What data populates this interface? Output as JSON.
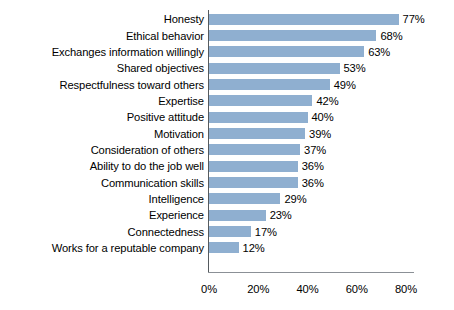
{
  "chart_data": {
    "type": "bar",
    "orientation": "horizontal",
    "title": "",
    "xlabel": "",
    "ylabel": "",
    "xlim": [
      0,
      80
    ],
    "grid": false,
    "legend": null,
    "bar_color": "#8fafd0",
    "axis_color": "#555a5e",
    "categories": [
      "Honesty",
      "Ethical behavior",
      "Exchanges information willingly",
      "Shared objectives",
      "Respectfulness toward others",
      "Expertise",
      "Positive attitude",
      "Motivation",
      "Consideration of others",
      "Ability to do the job well",
      "Communication skills",
      "Intelligence",
      "Experience",
      "Connectedness",
      "Works for a reputable company"
    ],
    "values": [
      77,
      68,
      63,
      53,
      49,
      42,
      40,
      39,
      37,
      36,
      36,
      29,
      23,
      17,
      12
    ],
    "value_labels": [
      "77%",
      "68%",
      "63%",
      "53%",
      "49%",
      "42%",
      "40%",
      "39%",
      "37%",
      "36%",
      "36%",
      "29%",
      "23%",
      "17%",
      "12%"
    ],
    "xticks": [
      0,
      20,
      40,
      60,
      80
    ],
    "xtick_labels": [
      "0%",
      "20%",
      "40%",
      "60%",
      "80%"
    ]
  }
}
